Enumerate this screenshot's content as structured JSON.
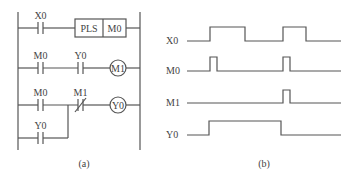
{
  "ladder": {
    "caption": "(a)",
    "rungs": [
      {
        "contact": "X0",
        "instruction": "PLS",
        "operand": "M0"
      },
      {
        "contacts": [
          "M0",
          "Y0"
        ],
        "coil": "M1"
      },
      {
        "contacts": [
          "M0",
          "M1"
        ],
        "parallel": "Y0",
        "coil": "Y0",
        "nc_contact": "M1"
      }
    ],
    "labels": {
      "r1_contact": "X0",
      "pls": "PLS",
      "pls_operand": "M0",
      "r2_c1": "M0",
      "r2_c2": "Y0",
      "r2_coil": "M1",
      "r3_c1": "M0",
      "r3_c2": "M1",
      "r3_coil": "Y0",
      "r3_parallel": "Y0"
    }
  },
  "timing": {
    "caption": "(b)",
    "signals": [
      {
        "name": "X0",
        "transitions": [
          [
            187,
            0
          ],
          [
            210,
            1
          ],
          [
            245,
            0
          ],
          [
            283,
            1
          ],
          [
            306,
            0
          ],
          [
            341,
            0
          ]
        ]
      },
      {
        "name": "M0",
        "transitions": [
          [
            187,
            0
          ],
          [
            210,
            1
          ],
          [
            217,
            0
          ],
          [
            283,
            1
          ],
          [
            290,
            0
          ],
          [
            341,
            0
          ]
        ]
      },
      {
        "name": "M1",
        "transitions": [
          [
            187,
            0
          ],
          [
            283,
            1
          ],
          [
            290,
            0
          ],
          [
            341,
            0
          ]
        ]
      },
      {
        "name": "Y0",
        "transitions": [
          [
            187,
            0
          ],
          [
            209,
            1
          ],
          [
            281,
            0
          ],
          [
            341,
            0
          ]
        ]
      }
    ]
  }
}
